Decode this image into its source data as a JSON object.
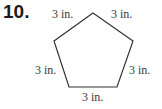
{
  "problem": {
    "number": "10."
  },
  "figure": {
    "shape": "regular-pentagon",
    "stroke_color": "#333333",
    "vertices": [
      [
        93,
        13
      ],
      [
        133,
        41
      ],
      [
        117,
        87
      ],
      [
        69,
        87
      ],
      [
        54,
        41
      ]
    ],
    "side_labels": {
      "top_left": "3 in.",
      "top_right": "3 in.",
      "left": "3 in.",
      "right": "3 in.",
      "bottom": "3 in."
    }
  }
}
